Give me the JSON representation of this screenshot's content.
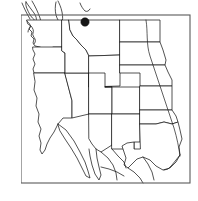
{
  "figure": {
    "kind": "distribution-map",
    "title": "",
    "caption": "",
    "region": "Western United States",
    "background_color": "#ffffff",
    "frame": {
      "visible": true,
      "color": "#5a5a5a",
      "x": 21,
      "y": 15,
      "width": 169,
      "height": 168
    },
    "line_color": "#1a1a1a",
    "fill_color": "#ffffff"
  },
  "map": {
    "projection_note": "plate-carree",
    "states_outlined": [
      "Washington",
      "Oregon",
      "Idaho",
      "Montana",
      "Wyoming",
      "North Dakota",
      "South Dakota",
      "Nebraska",
      "Kansas",
      "Oklahoma",
      "Texas",
      "New Mexico",
      "Colorado",
      "Utah",
      "Arizona",
      "Nevada",
      "California"
    ],
    "features": [
      {
        "name": "pacific-coastline",
        "label": "Pacific Coast"
      },
      {
        "name": "puget-sound",
        "label": "Puget Sound"
      },
      {
        "name": "vancouver-island",
        "label": "Vancouver Island"
      },
      {
        "name": "missouri-river",
        "label": "Missouri River"
      },
      {
        "name": "gulf-coast",
        "label": "Gulf of Mexico Coast"
      },
      {
        "name": "baja-california",
        "label": "Baja California"
      }
    ]
  },
  "occurrence_points": [
    {
      "id": 1,
      "label": "",
      "x": 85,
      "y": 22,
      "radius": 4.2,
      "color": "#161616",
      "marker": "filled-circle"
    }
  ],
  "legend": {
    "visible": false,
    "entries": []
  },
  "axes": {
    "visible": false,
    "tick_labels": []
  },
  "scale_bar": {
    "visible": false,
    "label": ""
  }
}
